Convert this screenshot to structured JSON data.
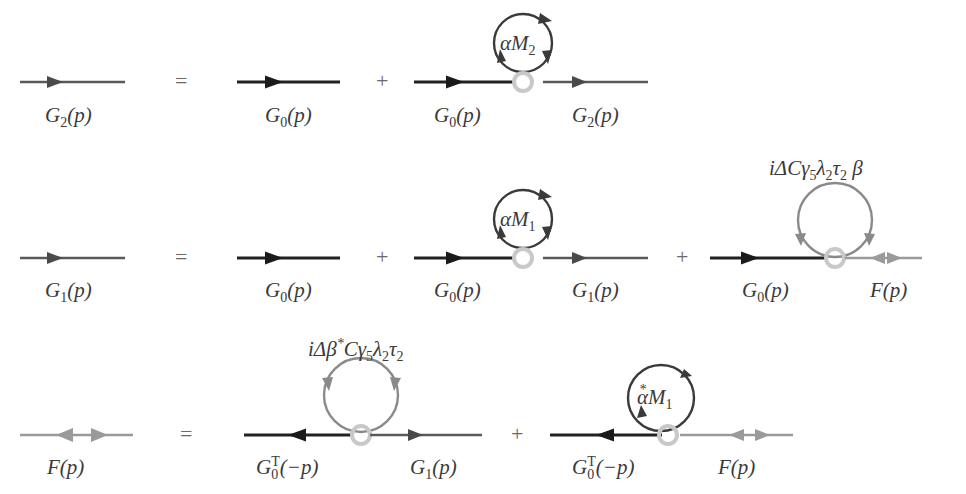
{
  "colors": {
    "bare": "#2a2a2a",
    "dressed": "#5a5a5a",
    "anomalous": "#9a9a9a",
    "vertex": "#c8c8c8"
  },
  "equations": [
    {
      "lhs": {
        "name": "G",
        "sub": "2",
        "arg": "(p)"
      },
      "equals": "=",
      "terms": [
        {
          "label": {
            "name": "G",
            "sub": "0",
            "arg": "(p)"
          }
        },
        {
          "plus": "+",
          "left": {
            "name": "G",
            "sub": "0",
            "arg": "(p)"
          },
          "right": {
            "name": "G",
            "sub": "2",
            "arg": "(p)"
          },
          "loop": {
            "pre": "α",
            "name": "M",
            "sub": "2"
          }
        }
      ]
    },
    {
      "lhs": {
        "name": "G",
        "sub": "1",
        "arg": "(p)"
      },
      "equals": "=",
      "terms": [
        {
          "label": {
            "name": "G",
            "sub": "0",
            "arg": "(p)"
          }
        },
        {
          "plus": "+",
          "left": {
            "name": "G",
            "sub": "0",
            "arg": "(p)"
          },
          "right": {
            "name": "G",
            "sub": "1",
            "arg": "(p)"
          },
          "loop": {
            "pre": "α",
            "name": "M",
            "sub": "1"
          }
        },
        {
          "plus": "+",
          "left": {
            "name": "G",
            "sub": "0",
            "arg": "(p)"
          },
          "right": {
            "name": "F",
            "arg": "(p)"
          },
          "loop": {
            "text": "iΔCγ5λ2τ2 β"
          }
        }
      ]
    },
    {
      "lhs": {
        "name": "F",
        "arg": "(p)"
      },
      "equals": "=",
      "terms": [
        {
          "left": {
            "name": "G",
            "sub": "0",
            "sup": "T",
            "arg": "(−p)"
          },
          "right": {
            "name": "G",
            "sub": "1",
            "arg": "(p)"
          },
          "loop": {
            "text": "iΔβ*Cγ5λ2τ2"
          }
        },
        {
          "plus": "+",
          "left": {
            "name": "G",
            "sub": "0",
            "sup": "T",
            "arg": "(−p)"
          },
          "right": {
            "name": "F",
            "arg": "(p)"
          },
          "loop": {
            "pre": "α*",
            "name": "M",
            "sub": "1"
          }
        }
      ]
    }
  ]
}
